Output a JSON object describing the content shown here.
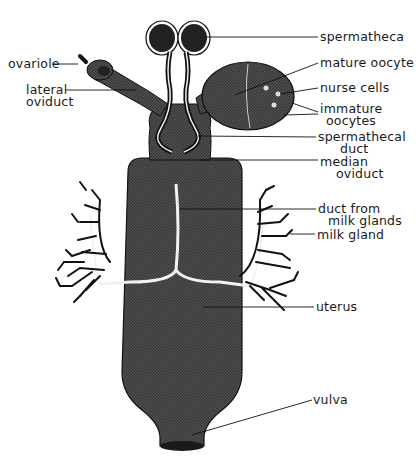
{
  "figure": {
    "colors": {
      "tissue_fill": "#4a4a4a",
      "tissue_dark": "#2b2b2b",
      "outline": "#111111",
      "background": "#ffffff",
      "duct_highlight": "#f2f2f2"
    }
  },
  "labels": {
    "spermatheca": "spermatheca",
    "mature_oocyte": "mature oocyte",
    "nurse_cells": "nurse cells",
    "immature_oocytes_1": "immature",
    "immature_oocytes_2": "oocytes",
    "spermathecal_duct_1": "spermathecal",
    "spermathecal_duct_2": "duct",
    "median_oviduct_1": "median",
    "median_oviduct_2": "oviduct",
    "duct_milk_1": "duct from",
    "duct_milk_2": "milk glands",
    "milk_gland": "milk gland",
    "uterus": "uterus",
    "vulva": "vulva",
    "ovariole": "ovariole",
    "lateral_oviduct_1": "lateral",
    "lateral_oviduct_2": "oviduct"
  }
}
